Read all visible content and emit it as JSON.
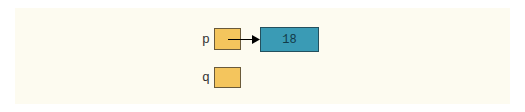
{
  "diagram": {
    "variables": [
      {
        "name": "p",
        "points_to": "object-18"
      },
      {
        "name": "q",
        "points_to": null
      }
    ],
    "objects": [
      {
        "id": "object-18",
        "value": "18"
      }
    ],
    "colors": {
      "background": "#fdfbf0",
      "pointer_box": "#f4c55d",
      "object_box": "#3a9bb5",
      "arrow": "#000000"
    }
  }
}
